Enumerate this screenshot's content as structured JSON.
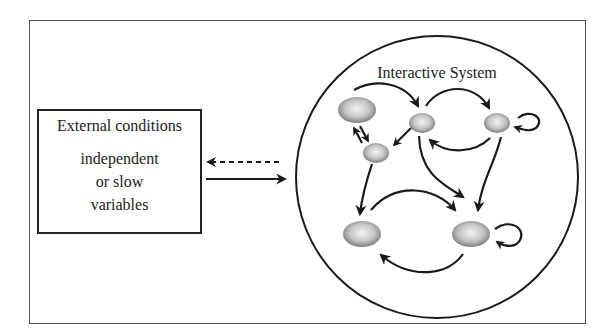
{
  "external": {
    "title": "External conditions",
    "lines": [
      "independent",
      "or slow",
      "variables"
    ]
  },
  "system": {
    "title": "Interactive System",
    "nodes": [
      {
        "id": "n1",
        "cx": 357,
        "cy": 110,
        "rx": 19,
        "ry": 13
      },
      {
        "id": "n2",
        "cx": 422,
        "cy": 123,
        "rx": 13,
        "ry": 10
      },
      {
        "id": "n3",
        "cx": 497,
        "cy": 123,
        "rx": 13,
        "ry": 10
      },
      {
        "id": "n4",
        "cx": 376,
        "cy": 153,
        "rx": 13,
        "ry": 10
      },
      {
        "id": "n5",
        "cx": 362,
        "cy": 234,
        "rx": 19,
        "ry": 13
      },
      {
        "id": "n6",
        "cx": 471,
        "cy": 234,
        "rx": 19,
        "ry": 13
      }
    ]
  },
  "connectors": {
    "feedback": "dashed arrow from system to external conditions",
    "forcing": "solid arrow from external conditions to system"
  },
  "colors": {
    "stroke": "#1a1a1a",
    "node_light": "#f2f2f2",
    "node_dark": "#7a7a7a",
    "frame": "#555555"
  }
}
